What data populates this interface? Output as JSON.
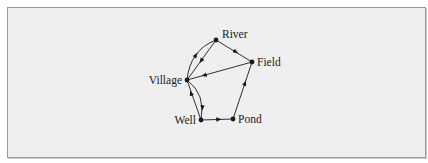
{
  "diagram": {
    "type": "directed-graph",
    "colors": {
      "background": "#efefef",
      "border": "#9a9a9a",
      "ink": "#1a1a1a"
    },
    "nodes": [
      {
        "id": "river",
        "label": "River",
        "x": 216,
        "y": 40
      },
      {
        "id": "field",
        "label": "Field",
        "x": 252,
        "y": 62
      },
      {
        "id": "village",
        "label": "Village",
        "x": 187,
        "y": 80
      },
      {
        "id": "well",
        "label": "Well",
        "x": 201,
        "y": 120
      },
      {
        "id": "pond",
        "label": "Pond",
        "x": 233,
        "y": 119
      }
    ],
    "edges": [
      {
        "from": "village",
        "to": "river",
        "style": "curved"
      },
      {
        "from": "river",
        "to": "village",
        "style": "straight"
      },
      {
        "from": "river",
        "to": "field",
        "style": "straight"
      },
      {
        "from": "field",
        "to": "village",
        "style": "straight"
      },
      {
        "from": "well",
        "to": "village",
        "style": "straight"
      },
      {
        "from": "village",
        "to": "well",
        "style": "curved"
      },
      {
        "from": "well",
        "to": "pond",
        "style": "straight"
      },
      {
        "from": "pond",
        "to": "field",
        "style": "straight"
      }
    ]
  }
}
